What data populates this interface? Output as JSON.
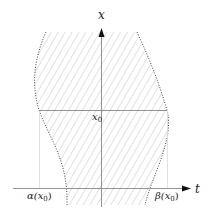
{
  "diagram": {
    "axes": {
      "vertical_label": "x",
      "horizontal_label": "t"
    },
    "labels": {
      "x0": "x",
      "x0_sub": "0",
      "alpha": "α(x",
      "alpha_sub": "0",
      "alpha_close": ")",
      "beta": "β(x",
      "beta_sub": "0",
      "beta_close": ")"
    },
    "colors": {
      "axis": "#555555",
      "hatch": "#c8c8c8",
      "boundary": "#444444",
      "guide": "#dddddd"
    }
  }
}
